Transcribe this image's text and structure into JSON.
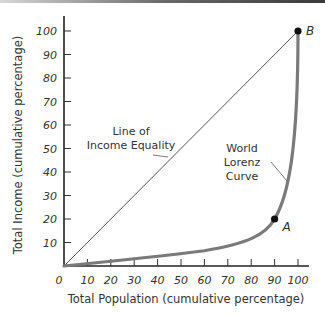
{
  "chart_data": {
    "type": "line",
    "title": "",
    "xlabel": "Total Population (cumulative percentage)",
    "ylabel": "Total Income (cumulative percentage)",
    "xlim": [
      0,
      100
    ],
    "ylim": [
      0,
      100
    ],
    "origin_label": "0",
    "x_ticks": [
      "10",
      "20",
      "30",
      "40",
      "50",
      "60",
      "70",
      "80",
      "90",
      "100"
    ],
    "y_ticks": [
      "10",
      "20",
      "30",
      "40",
      "50",
      "60",
      "70",
      "80",
      "90",
      "100"
    ],
    "grid": false,
    "series": [
      {
        "name": "Line of Income Equality",
        "x": [
          0,
          100
        ],
        "y": [
          0,
          100
        ],
        "color": "#555555"
      },
      {
        "name": "World Lorenz Curve",
        "x": [
          0,
          10,
          20,
          30,
          40,
          50,
          60,
          70,
          80,
          85,
          90,
          95,
          98,
          100
        ],
        "y": [
          0,
          1.5,
          2.5,
          3.5,
          4.5,
          5.5,
          6.5,
          8,
          11,
          14,
          20,
          35,
          60,
          100
        ],
        "color": "#7a7a7a"
      }
    ],
    "annotations": [
      {
        "text_lines": [
          "Line of",
          "Income Equality"
        ],
        "target": "Line of Income Equality"
      },
      {
        "text_lines": [
          "World",
          "Lorenz",
          "Curve"
        ],
        "target": "World Lorenz Curve"
      }
    ],
    "points": [
      {
        "label": "A",
        "x": 90,
        "y": 20
      },
      {
        "label": "B",
        "x": 100,
        "y": 100
      }
    ]
  }
}
